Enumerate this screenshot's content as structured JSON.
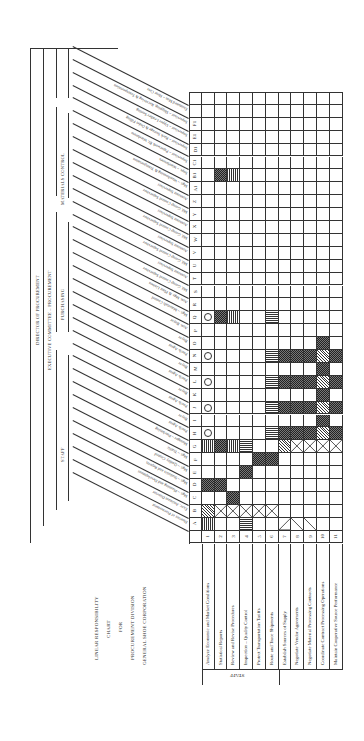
{
  "title_block": {
    "lines": [
      "LINEAR RESPONSIBILITY",
      "CHART",
      "FOR",
      "PROCUREMENT DIVISION",
      "GENERAL SHOE CORPORATION"
    ]
  },
  "org_headers": {
    "director": "DIRECTOR OF PROCUREMENT",
    "committee": "EXECUTIVE COMMITTEE – PROCUREMENT",
    "groups": [
      {
        "label": "STAFF"
      },
      {
        "label": "PURCHASING"
      },
      {
        "label": "MATERIALS CONTROL"
      }
    ]
  },
  "positions": [
    {
      "code": "A",
      "title": "Director of Procurement"
    },
    {
      "code": "B",
      "title": "Exec. Assistant Director"
    },
    {
      "code": "C",
      "title": "Mgr. – Planning and Development"
    },
    {
      "code": "D",
      "title": "Mgr. – Statistics and Reports"
    },
    {
      "code": "E",
      "title": "Mgr. – Quality Control"
    },
    {
      "code": "F",
      "title": "Mgr. – Traffic"
    },
    {
      "code": "G",
      "title": "Manager – Purchasing"
    },
    {
      "code": "H",
      "title": "Purch. Agent",
      "group": "Sole Leather and Supply Branch Materials"
    },
    {
      "code": "I",
      "title": "Buyer",
      "group": "Sole Leather and Supply Branch Materials"
    },
    {
      "code": "J",
      "title": "Purch. Agent",
      "group": "Cut. Ext. Fabrics and Linings"
    },
    {
      "code": "K",
      "title": "Buyer",
      "group": "Cut. Ext. Fabrics and Linings"
    },
    {
      "code": "L",
      "title": "Purch. Agent",
      "group": "Hides, Sole Leather and Cut Soles"
    },
    {
      "code": "M",
      "title": "Buyer",
      "group": "Hides, Sole Leather and Cut Soles"
    },
    {
      "code": "N",
      "title": "Purch. Agent",
      "group": "Findings and Supplies"
    },
    {
      "code": "O",
      "title": "Buyer",
      "group": "Findings and Supplies"
    },
    {
      "code": "P",
      "title": "Asst. Buyer",
      "group": "Findings and Supplies"
    },
    {
      "code": "Q",
      "title": "Mgr. – Materials Control"
    },
    {
      "code": "R",
      "title": "Asst. Mgr. & Plant Liaison"
    },
    {
      "code": "S",
      "title": "Mtl. Group Control Supervisor",
      "group": "Findings Bottom"
    },
    {
      "code": "T",
      "title": "Assistant Supervisor",
      "group": "Findings Bottom"
    },
    {
      "code": "U",
      "title": "Mtl. Group Control Supervisor",
      "group": "Findings Upper"
    },
    {
      "code": "V",
      "title": "Assistant Supervisor",
      "group": "Findings Upper"
    },
    {
      "code": "W",
      "title": "Mtl. Group Control Supervisor",
      "group": "Upper Leather Fabrics and Linings"
    },
    {
      "code": "X",
      "title": "Assistant Supervisor",
      "group": "Upper Leather Fabrics and Linings"
    },
    {
      "code": "Y",
      "title": "Mtl. Group Control Supervisor",
      "group": "Soleing and Supply Branch"
    },
    {
      "code": "Z",
      "title": "Assistant Supervisor",
      "group": "Soleing and Supply Branch"
    },
    {
      "code": "A1",
      "title": "Mgr. – Warehousing & Transportation"
    },
    {
      "code": "B1",
      "title": "Supt. – Warehouses"
    },
    {
      "code": "C1",
      "title": "Supervisor – Paperwork Br. Warehouse"
    },
    {
      "code": "D1",
      "title": "Supervisor – Rack Storage & Order Filling"
    },
    {
      "code": "E1",
      "title": "Supervisor – Upper Leather Sorting"
    },
    {
      "code": "F1",
      "title": "Supervisor – Shipping, Receiving & Transportation"
    },
    {
      "code": "",
      "title": "Estimated Man – Hour Cost"
    }
  ],
  "row_order_top_to_bottom": [
    "",
    "",
    "F1",
    "E1",
    "D1",
    "C1",
    "B1",
    "A1",
    "Z",
    "Y",
    "X",
    "W",
    "V",
    "U",
    "T",
    "S",
    "R",
    "Q",
    "P",
    "O",
    "N",
    "M",
    "L",
    "K",
    "J",
    "I",
    "H",
    "G",
    "F",
    "E",
    "D",
    "C",
    "B",
    "A"
  ],
  "tasks": [
    {
      "num": "1",
      "label": "Analyze Economic and Market Conditions",
      "section": "STAFF"
    },
    {
      "num": "2",
      "label": "Statistical Reports",
      "section": "STAFF"
    },
    {
      "num": "3",
      "label": "Review and Revise Procedures",
      "section": "STAFF"
    },
    {
      "num": "4",
      "label": "Inspection – Quality Control",
      "section": "STAFF"
    },
    {
      "num": "5",
      "label": "Protect Transportation Tariffs",
      "section": "STAFF"
    },
    {
      "num": "6",
      "label": "Route and Trace Shipments",
      "section": "STAFF"
    },
    {
      "num": "7",
      "label": "Establish Sources of Supply",
      "section": ""
    },
    {
      "num": "8",
      "label": "Negotiate Vendor Agreements",
      "section": ""
    },
    {
      "num": "9",
      "label": "Negotiate Material Processing Contracts",
      "section": ""
    },
    {
      "num": "10",
      "label": "Coordinate Contract Processing Operations",
      "section": ""
    },
    {
      "num": "11",
      "label": "Maintain Cooperative Source Performance",
      "section": ""
    }
  ],
  "section_label": "STAFF",
  "cells": [
    {
      "row": "A",
      "task": 1,
      "symbol": "vstripe"
    },
    {
      "row": "A",
      "task": 4,
      "symbol": "hstripe"
    },
    {
      "row": "A",
      "task": 7,
      "symbol": "xhalf"
    },
    {
      "row": "A",
      "task": 8,
      "symbol": "slash"
    },
    {
      "row": "A",
      "task": 9,
      "symbol": "slash"
    },
    {
      "row": "B",
      "task": 1,
      "symbol": "diag"
    },
    {
      "row": "B",
      "task": 2,
      "symbol": "x"
    },
    {
      "row": "B",
      "task": 3,
      "symbol": "x"
    },
    {
      "row": "B",
      "task": 4,
      "symbol": "x"
    },
    {
      "row": "B",
      "task": 5,
      "symbol": "x"
    },
    {
      "row": "B",
      "task": 6,
      "symbol": "x"
    },
    {
      "row": "C",
      "task": 3,
      "symbol": "check"
    },
    {
      "row": "D",
      "task": 1,
      "symbol": "check"
    },
    {
      "row": "D",
      "task": 2,
      "symbol": "check"
    },
    {
      "row": "E",
      "task": 4,
      "symbol": "check"
    },
    {
      "row": "F",
      "task": 5,
      "symbol": "check"
    },
    {
      "row": "F",
      "task": 6,
      "symbol": "check"
    },
    {
      "row": "G",
      "task": 1,
      "symbol": "vstripe"
    },
    {
      "row": "G",
      "task": 2,
      "symbol": "check"
    },
    {
      "row": "G",
      "task": 3,
      "symbol": "vstripe"
    },
    {
      "row": "G",
      "task": 4,
      "symbol": "hstripe"
    },
    {
      "row": "G",
      "task": 7,
      "symbol": "diag"
    },
    {
      "row": "G",
      "task": 8,
      "symbol": "x"
    },
    {
      "row": "G",
      "task": 9,
      "symbol": "x"
    },
    {
      "row": "G",
      "task": 10,
      "symbol": "x"
    },
    {
      "row": "G",
      "task": 11,
      "symbol": "x"
    },
    {
      "row": "H",
      "task": 1,
      "symbol": "circle"
    },
    {
      "row": "H",
      "task": 6,
      "symbol": "hstripe"
    },
    {
      "row": "H",
      "task": 7,
      "symbol": "check"
    },
    {
      "row": "H",
      "task": 8,
      "symbol": "check"
    },
    {
      "row": "H",
      "task": 9,
      "symbol": "check"
    },
    {
      "row": "H",
      "task": 10,
      "symbol": "diag"
    },
    {
      "row": "H",
      "task": 11,
      "symbol": "check"
    },
    {
      "row": "I",
      "task": 10,
      "symbol": "check"
    },
    {
      "row": "J",
      "task": 1,
      "symbol": "circle"
    },
    {
      "row": "J",
      "task": 6,
      "symbol": "hstripe"
    },
    {
      "row": "J",
      "task": 7,
      "symbol": "check"
    },
    {
      "row": "J",
      "task": 8,
      "symbol": "check"
    },
    {
      "row": "J",
      "task": 9,
      "symbol": "check"
    },
    {
      "row": "J",
      "task": 10,
      "symbol": "diag"
    },
    {
      "row": "J",
      "task": 11,
      "symbol": "check"
    },
    {
      "row": "K",
      "task": 10,
      "symbol": "check"
    },
    {
      "row": "L",
      "task": 1,
      "symbol": "circle"
    },
    {
      "row": "L",
      "task": 6,
      "symbol": "hstripe"
    },
    {
      "row": "L",
      "task": 7,
      "symbol": "check"
    },
    {
      "row": "L",
      "task": 8,
      "symbol": "check"
    },
    {
      "row": "L",
      "task": 9,
      "symbol": "check"
    },
    {
      "row": "L",
      "task": 10,
      "symbol": "diag"
    },
    {
      "row": "L",
      "task": 11,
      "symbol": "check"
    },
    {
      "row": "M",
      "task": 10,
      "symbol": "check"
    },
    {
      "row": "N",
      "task": 1,
      "symbol": "circle"
    },
    {
      "row": "N",
      "task": 6,
      "symbol": "hstripe"
    },
    {
      "row": "N",
      "task": 7,
      "symbol": "check"
    },
    {
      "row": "N",
      "task": 8,
      "symbol": "check"
    },
    {
      "row": "N",
      "task": 9,
      "symbol": "check"
    },
    {
      "row": "N",
      "task": 10,
      "symbol": "diag"
    },
    {
      "row": "N",
      "task": 11,
      "symbol": "check"
    },
    {
      "row": "O",
      "task": 10,
      "symbol": "check"
    },
    {
      "row": "Q",
      "task": 1,
      "symbol": "circle"
    },
    {
      "row": "Q",
      "task": 2,
      "symbol": "check"
    },
    {
      "row": "Q",
      "task": 3,
      "symbol": "vstripe"
    },
    {
      "row": "Q",
      "task": 6,
      "symbol": "hstripe"
    },
    {
      "row": "B1",
      "task": 2,
      "symbol": "check"
    },
    {
      "row": "B1",
      "task": 3,
      "symbol": "vstripe"
    }
  ]
}
